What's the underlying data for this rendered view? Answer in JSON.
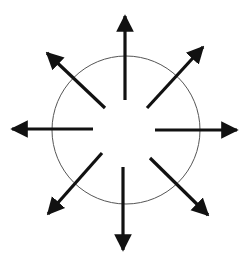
{
  "diagram": {
    "title": "",
    "background": "#ffffff",
    "stroke_color": "#111111",
    "circle": {
      "cx": 126,
      "cy": 130,
      "r": 74,
      "stroke": "#555555",
      "stroke_width": 1
    },
    "arrows": [
      {
        "name": "arrow-up",
        "x1": 125,
        "y1": 100,
        "x2": 125,
        "y2": 16
      },
      {
        "name": "arrow-up-right",
        "x1": 147,
        "y1": 108,
        "x2": 203,
        "y2": 47
      },
      {
        "name": "arrow-right",
        "x1": 155,
        "y1": 130,
        "x2": 237,
        "y2": 130
      },
      {
        "name": "arrow-down-right",
        "x1": 150,
        "y1": 158,
        "x2": 208,
        "y2": 215
      },
      {
        "name": "arrow-down",
        "x1": 123,
        "y1": 167,
        "x2": 123,
        "y2": 250
      },
      {
        "name": "arrow-down-left",
        "x1": 102,
        "y1": 153,
        "x2": 48,
        "y2": 214
      },
      {
        "name": "arrow-left",
        "x1": 93,
        "y1": 129,
        "x2": 12,
        "y2": 129
      },
      {
        "name": "arrow-up-left",
        "x1": 105,
        "y1": 108,
        "x2": 47,
        "y2": 53
      }
    ]
  }
}
